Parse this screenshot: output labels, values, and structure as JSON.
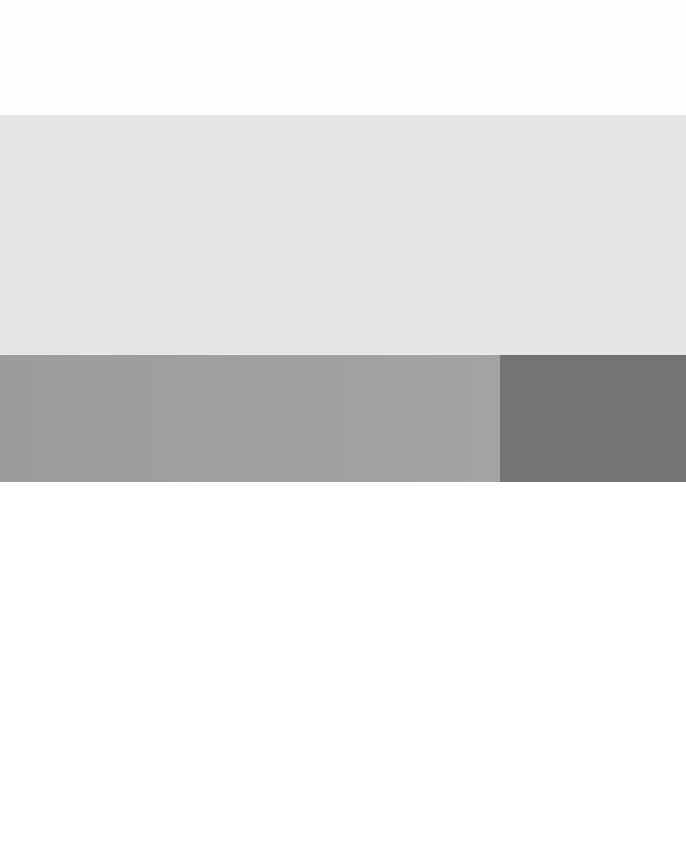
{
  "colors": {
    "top_band": "#fefefe",
    "light_block": "#e6e6e6",
    "mid_block": "#a0a0a0",
    "dark_block": "#747474",
    "bottom_band": "#ffffff"
  }
}
